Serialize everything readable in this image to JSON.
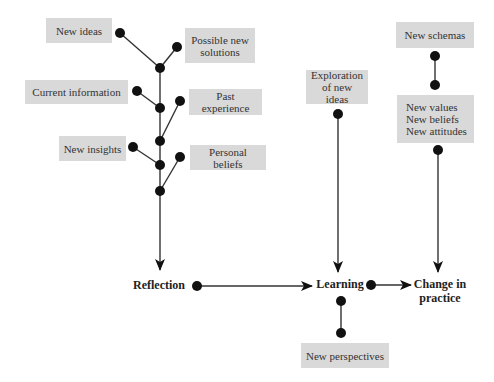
{
  "diagram": {
    "type": "flow-diagram",
    "inputs": {
      "new_ideas": "New ideas",
      "possible_new_solutions": [
        "Possible new",
        "solutions"
      ],
      "current_information": "Current information",
      "past_experience": "Past experience",
      "new_insights": "New insights",
      "personal_beliefs": "Personal beliefs",
      "exploration": [
        "Exploration",
        "of new ideas"
      ],
      "new_schemas": "New schemas",
      "new_values_block": [
        "New values",
        "New beliefs",
        "New attitudes"
      ],
      "new_perspectives": "New perspectives"
    },
    "stages": {
      "reflection": "Reflection",
      "learning": "Learning",
      "change_in_practice": [
        "Change in",
        "practice"
      ]
    },
    "colors": {
      "box_fill": "#d9d9d9",
      "line": "#333333",
      "node": "#111111"
    },
    "flows": [
      {
        "from": "Reflection",
        "to": "Learning"
      },
      {
        "from": "Learning",
        "to": "Change in practice"
      },
      {
        "from": "Exploration of new ideas",
        "to": "Learning"
      },
      {
        "from": "New values / New beliefs / New attitudes",
        "to": "Change in practice"
      },
      {
        "from": "Input branches",
        "to": "Reflection"
      }
    ]
  }
}
